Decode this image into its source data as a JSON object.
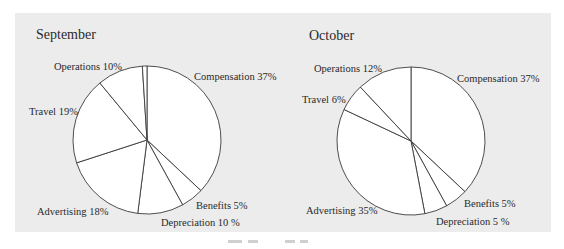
{
  "chart_data": [
    {
      "type": "pie",
      "title": "September",
      "start": "12 o'clock",
      "direction": "clockwise",
      "slices": [
        {
          "label": "Compensation",
          "value": 37,
          "text": "Compensation 37%"
        },
        {
          "label": "Benefits",
          "value": 5,
          "text": "Benefits 5%"
        },
        {
          "label": "Depreciation",
          "value": 10,
          "text": "Depreciation 10 %"
        },
        {
          "label": "Advertising",
          "value": 18,
          "text": "Advertising 18%"
        },
        {
          "label": "Travel",
          "value": 19,
          "text": "Travel 19%"
        },
        {
          "label": "Operations",
          "value": 10,
          "text": "Operations 10%"
        }
      ]
    },
    {
      "type": "pie",
      "title": "October",
      "start": "12 o'clock",
      "direction": "clockwise",
      "slices": [
        {
          "label": "Compensation",
          "value": 37,
          "text": "Compensation 37%"
        },
        {
          "label": "Benefits",
          "value": 5,
          "text": "Benefits 5%"
        },
        {
          "label": "Depreciation",
          "value": 5,
          "text": "Depreciation 5 %"
        },
        {
          "label": "Advertising",
          "value": 35,
          "text": "Advertising 35%"
        },
        {
          "label": "Travel",
          "value": 6,
          "text": "Travel 6%"
        },
        {
          "label": "Operations",
          "value": 12,
          "text": "Operations 12%"
        }
      ]
    }
  ],
  "colors": {
    "panel": "#ececec",
    "slice_fill": "#ffffff",
    "stroke": "#3a3a3a"
  }
}
